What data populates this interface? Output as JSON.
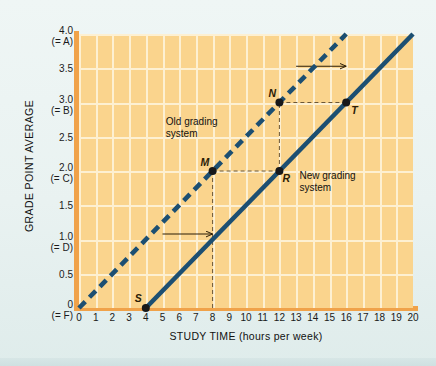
{
  "chart_data": {
    "type": "line",
    "title": "",
    "xlabel": "STUDY TIME (hours per week)",
    "ylabel": "GRADE  POINT AVERAGE",
    "xlim": [
      0,
      20
    ],
    "ylim": [
      0,
      4.0
    ],
    "grid": true,
    "legend": "none",
    "x_ticks": [
      "0",
      "1",
      "2",
      "3",
      "4",
      "5",
      "6",
      "7",
      "8",
      "9",
      "10",
      "11",
      "12",
      "13",
      "14",
      "15",
      "16",
      "17",
      "18",
      "19",
      "20"
    ],
    "y_ticks": [
      {
        "value": 0,
        "label": "0",
        "grade": "(= F)"
      },
      {
        "value": 0.5,
        "label": "0.5",
        "grade": ""
      },
      {
        "value": 1.0,
        "label": "1.0",
        "grade": "(= D)"
      },
      {
        "value": 1.5,
        "label": "1.5",
        "grade": ""
      },
      {
        "value": 2.0,
        "label": "2.0",
        "grade": "(= C)"
      },
      {
        "value": 2.5,
        "label": "2.5",
        "grade": ""
      },
      {
        "value": 3.0,
        "label": "3.0",
        "grade": "(= B)"
      },
      {
        "value": 3.5,
        "label": "3.5",
        "grade": ""
      },
      {
        "value": 4.0,
        "label": "4.0",
        "grade": "(= A)"
      }
    ],
    "series": [
      {
        "name": "Old grading system",
        "style": "dashed",
        "color": "#1c4f72",
        "x": [
          0,
          16
        ],
        "y": [
          0,
          4.0
        ],
        "slope": 0.25,
        "intercept": 0
      },
      {
        "name": "New grading system",
        "style": "solid",
        "color": "#1c4f72",
        "x": [
          4,
          20
        ],
        "y": [
          0,
          4.0
        ],
        "slope": 0.25,
        "intercept": -1.0
      }
    ],
    "points": [
      {
        "label": "S",
        "x": 4,
        "y": 0.0,
        "series": "New grading system"
      },
      {
        "label": "M",
        "x": 8,
        "y": 2.0,
        "series": "Old grading system"
      },
      {
        "label": "N",
        "x": 12,
        "y": 3.0,
        "series": "Old grading system"
      },
      {
        "label": "R",
        "x": 12,
        "y": 2.0,
        "series": "New grading system"
      },
      {
        "label": "T",
        "x": 16,
        "y": 3.0,
        "series": "New grading system"
      }
    ],
    "annotations": [
      {
        "text": "Old grading\nsystem",
        "x": 5.2,
        "y": 2.72
      },
      {
        "text": "New grading\nsystem",
        "x": 13.2,
        "y": 1.92
      }
    ],
    "arrows": [
      {
        "direction": "right",
        "x_start": 5.0,
        "x_end": 8.0,
        "y": 1.08
      },
      {
        "direction": "right",
        "x_start": 13.0,
        "x_end": 16.0,
        "y": 3.53
      }
    ],
    "guides": [
      {
        "from": {
          "x": 8,
          "y": 0.0
        },
        "to": {
          "x": 8,
          "y": 2.0
        },
        "style": "dashed"
      },
      {
        "from": {
          "x": 8,
          "y": 2.0
        },
        "to": {
          "x": 12,
          "y": 2.0
        },
        "style": "dashed"
      },
      {
        "from": {
          "x": 12,
          "y": 2.0
        },
        "to": {
          "x": 12,
          "y": 3.0
        },
        "style": "dashed"
      },
      {
        "from": {
          "x": 12,
          "y": 3.0
        },
        "to": {
          "x": 16,
          "y": 3.0
        },
        "style": "dashed"
      }
    ]
  },
  "axes": {
    "x_title": "STUDY TIME (hours per week)",
    "y_title": "GRADE  POINT AVERAGE"
  },
  "labels": {
    "old_system_line1": "Old grading",
    "old_system_line2": "system",
    "new_system_line1": "New grading",
    "new_system_line2": "system",
    "point_s": "S",
    "point_m": "M",
    "point_n": "N",
    "point_r": "R",
    "point_t": "T"
  },
  "colors": {
    "plot_background": "#fad48d",
    "gridline": "#fdf0d2",
    "axis_rail": "#f0a24a",
    "line": "#1c4f72",
    "guide": "#6b5636",
    "page_background": "#eef5f4"
  }
}
